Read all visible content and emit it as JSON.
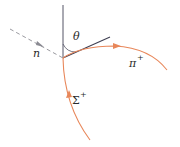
{
  "diagram": {
    "type": "particle-decay",
    "labels": {
      "incoming": "n",
      "angle": "θ",
      "outgoing": "π",
      "outgoing_charge": "+",
      "parent": "Σ",
      "parent_charge": "+"
    },
    "colors": {
      "track": "#e8875a",
      "reference_line": "#555566",
      "neutral_dashed": "#9a9aa0",
      "text": "#2a2a2a"
    }
  }
}
